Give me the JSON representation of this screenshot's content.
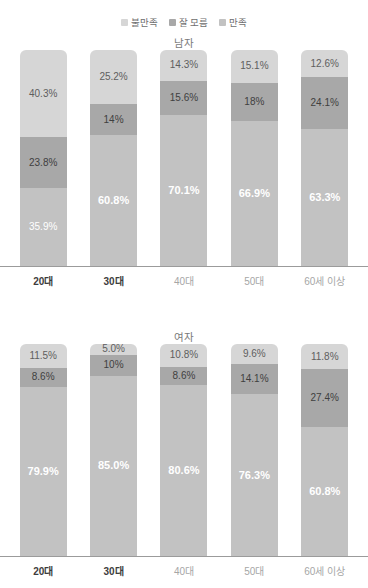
{
  "title": "",
  "legend": {
    "items": [
      {
        "label": "불만족",
        "color": "#d6d6d6",
        "key": "neg"
      },
      {
        "label": "잘 모름",
        "color": "#a8a8a8",
        "key": "unk"
      },
      {
        "label": "만족",
        "color": "#c2c2c2",
        "key": "pos"
      }
    ]
  },
  "panels": {
    "male": {
      "title": "남자"
    },
    "female": {
      "title": "여자"
    }
  },
  "axis": {
    "categories": [
      "20대",
      "30대",
      "40대",
      "50대",
      "60세 이상"
    ],
    "emphasized": [
      true,
      true,
      false,
      false,
      false
    ]
  },
  "chart_data": {
    "type": "bar",
    "subtype": "stacked-100-percent",
    "title": "",
    "xlabel": "",
    "ylabel": "",
    "ylim": [
      0,
      100
    ],
    "grid": false,
    "legend_position": "top-center",
    "categories": [
      "20대",
      "30대",
      "40대",
      "50대",
      "60세 이상"
    ],
    "panels": [
      {
        "name": "남자",
        "series": [
          {
            "name": "만족",
            "values": [
              35.9,
              60.8,
              70.1,
              66.9,
              63.3
            ],
            "labels": [
              "35.9%",
              "60.8%",
              "70.1%",
              "66.9%",
              "63.3%"
            ]
          },
          {
            "name": "잘 모름",
            "values": [
              23.8,
              14.0,
              15.6,
              18.0,
              24.1
            ],
            "labels": [
              "23.8%",
              "14%",
              "15.6%",
              "18%",
              "24.1%"
            ]
          },
          {
            "name": "불만족",
            "values": [
              40.3,
              25.2,
              14.3,
              15.1,
              12.6
            ],
            "labels": [
              "40.3%",
              "25.2%",
              "14.3%",
              "15.1%",
              "12.6%"
            ]
          }
        ]
      },
      {
        "name": "여자",
        "series": [
          {
            "name": "만족",
            "values": [
              79.9,
              85.0,
              80.6,
              76.3,
              60.8
            ],
            "labels": [
              "79.9%",
              "85.0%",
              "80.6%",
              "76.3%",
              "60.8%"
            ]
          },
          {
            "name": "잘 모름",
            "values": [
              8.6,
              10.0,
              8.6,
              14.1,
              27.4
            ],
            "labels": [
              "8.6%",
              "10%",
              "8.6%",
              "14.1%",
              "27.4%"
            ]
          },
          {
            "name": "불만족",
            "values": [
              11.5,
              5.0,
              10.8,
              9.6,
              11.8
            ],
            "labels": [
              "11.5%",
              "5.0%",
              "10.8%",
              "9.6%",
              "11.8%"
            ]
          }
        ]
      }
    ]
  }
}
